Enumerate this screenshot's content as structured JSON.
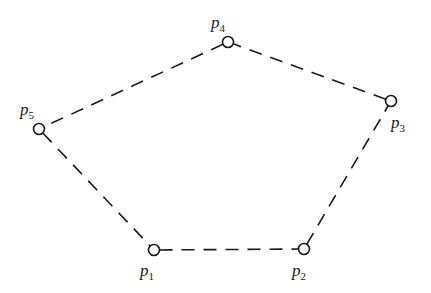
{
  "diagram": {
    "type": "polygon",
    "edge_style": "dashed",
    "vertices": [
      {
        "id": "p1",
        "label": "p",
        "subscript": "1",
        "x": 154,
        "y": 250,
        "label_x": 140,
        "label_y": 276
      },
      {
        "id": "p2",
        "label": "p",
        "subscript": "2",
        "x": 304,
        "y": 249,
        "label_x": 292,
        "label_y": 276
      },
      {
        "id": "p3",
        "label": "p",
        "subscript": "3",
        "x": 391,
        "y": 101,
        "label_x": 391,
        "label_y": 128
      },
      {
        "id": "p4",
        "label": "p",
        "subscript": "4",
        "x": 228,
        "y": 42,
        "label_x": 211,
        "label_y": 28
      },
      {
        "id": "p5",
        "label": "p",
        "subscript": "5",
        "x": 39,
        "y": 129,
        "label_x": 20,
        "label_y": 115
      }
    ],
    "edges": [
      [
        "p1",
        "p2"
      ],
      [
        "p2",
        "p3"
      ],
      [
        "p3",
        "p4"
      ],
      [
        "p4",
        "p5"
      ],
      [
        "p5",
        "p1"
      ]
    ]
  }
}
